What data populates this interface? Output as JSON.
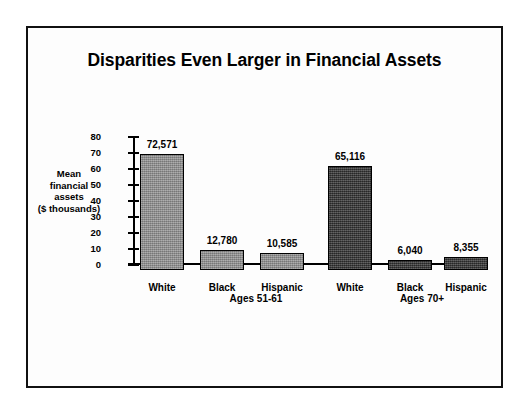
{
  "chart": {
    "title": "Disparities Even Larger in Financial Assets",
    "ylabel_lines": [
      "Mean",
      "financial",
      "assets",
      "($ thousands)"
    ]
  },
  "chart_data": {
    "type": "bar",
    "title": "Disparities Even Larger in Financial Assets",
    "xlabel": "",
    "ylabel": "Mean financial assets ($ thousands)",
    "ylim": [
      0,
      80
    ],
    "yticks": [
      0,
      10,
      20,
      30,
      40,
      50,
      60,
      70,
      80
    ],
    "grid": false,
    "legend": "none",
    "units_note": "Bar value labels are in dollars; axis is in thousands of dollars",
    "groups": [
      {
        "name": "Ages 51-61",
        "categories": [
          "White",
          "Black",
          "Hispanic"
        ],
        "labels": [
          "72,571",
          "12,780",
          "10,585"
        ],
        "values": [
          72.571,
          12.78,
          10.585
        ],
        "color": "#8f8f8f"
      },
      {
        "name": "Ages 70+",
        "categories": [
          "White",
          "Black",
          "Hispanic"
        ],
        "labels": [
          "65,116",
          "6,040",
          "8,355"
        ],
        "values": [
          65.116,
          6.04,
          8.355
        ],
        "color": "#3b3b3b"
      }
    ]
  },
  "bars": [
    {
      "label": "72,571",
      "category": "White",
      "value": 72.571,
      "shade": "light",
      "left": 36,
      "width": 44
    },
    {
      "label": "12,780",
      "category": "Black",
      "value": 12.78,
      "shade": "light",
      "left": 96,
      "width": 44
    },
    {
      "label": "10,585",
      "category": "Hispanic",
      "value": 10.585,
      "shade": "light",
      "left": 156,
      "width": 44
    },
    {
      "label": "65,116",
      "category": "White",
      "value": 65.116,
      "shade": "dark",
      "left": 224,
      "width": 44
    },
    {
      "label": "6,040",
      "category": "Black",
      "value": 6.04,
      "shade": "dark",
      "left": 284,
      "width": 44
    },
    {
      "label": "8,355",
      "category": "Hispanic",
      "value": 8.355,
      "shade": "dark",
      "left": 340,
      "width": 44
    }
  ],
  "group_labels": [
    {
      "text": "Ages 51-61",
      "center": 152
    },
    {
      "text": "Ages 70+",
      "center": 318
    }
  ]
}
